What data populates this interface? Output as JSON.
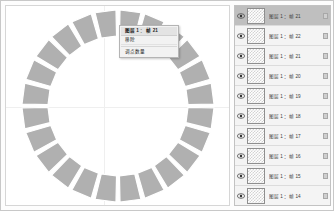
{
  "colors": {
    "app_background": "#fdfdfd",
    "stage_background": "#ffffff",
    "panel_background": "#f4f4f4",
    "selection_highlight": "#bfbfbf",
    "segment_fill": "#b0b0b0",
    "segment_stroke": "#ffffff",
    "guide_line": "#efefef",
    "menu_background": "#f2f2f2",
    "menu_highlight": "#e3e3e3"
  },
  "stage": {
    "name": "canvas-stage",
    "guides": {
      "vertical_x_pct": 44,
      "horizontal_y_pct": 51
    },
    "shape": {
      "type": "segmented-ring",
      "segment_count": 24,
      "outer_radius": 96,
      "inner_radius": 70,
      "gap_degrees": 2.4,
      "start_angle_degrees": -90,
      "fill": "#b0b0b0",
      "stroke": "#ffffff"
    }
  },
  "context_menu": {
    "name": "canvas-context-menu",
    "items": [
      {
        "label": "图层 1 ： 帧 21",
        "highlighted": true
      },
      {
        "label": "移除",
        "highlighted": false
      },
      {
        "label": "调点数量",
        "highlighted": false
      }
    ]
  },
  "panel": {
    "title": "layers-panel",
    "rows": [
      {
        "label": "图层 1 ：帧 21",
        "selected": true,
        "visible": true,
        "locked": true
      },
      {
        "label": "图层 1 ：帧 22",
        "selected": false,
        "visible": true,
        "locked": true
      },
      {
        "label": "图层 1 ：帧 21",
        "selected": false,
        "visible": true,
        "locked": true
      },
      {
        "label": "图层 1 ：帧 20",
        "selected": false,
        "visible": true,
        "locked": true
      },
      {
        "label": "图层 1 ：帧 19",
        "selected": false,
        "visible": true,
        "locked": true
      },
      {
        "label": "图层 1 ：帧 18",
        "selected": false,
        "visible": true,
        "locked": true
      },
      {
        "label": "图层 1 ：帧 17",
        "selected": false,
        "visible": true,
        "locked": true
      },
      {
        "label": "图层 1 ：帧 16",
        "selected": false,
        "visible": true,
        "locked": true
      },
      {
        "label": "图层 1 ：帧 15",
        "selected": false,
        "visible": true,
        "locked": true
      },
      {
        "label": "图层 1 ：帧 14",
        "selected": false,
        "visible": true,
        "locked": true
      }
    ]
  }
}
